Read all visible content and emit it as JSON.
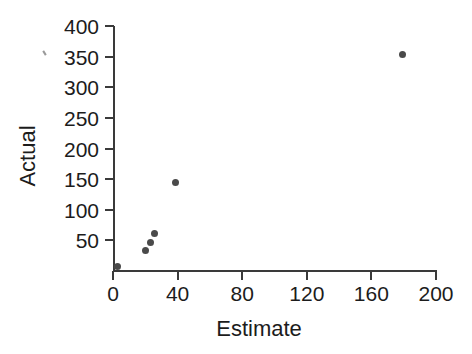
{
  "chart_data": {
    "type": "scatter",
    "title": "",
    "xlabel": "Estimate",
    "ylabel": "Actual",
    "xlim": [
      0,
      200
    ],
    "ylim": [
      0,
      400
    ],
    "xticks": [
      0,
      40,
      80,
      120,
      160,
      200
    ],
    "xtick_labels": [
      "0",
      "40",
      "80",
      "120",
      "160",
      "200"
    ],
    "yticks": [
      50,
      100,
      150,
      200,
      250,
      300,
      350,
      400
    ],
    "ytick_labels": [
      "50",
      "100",
      "150",
      "200",
      "250",
      "300",
      "350",
      "400"
    ],
    "grid": false,
    "legend": null,
    "marker": "circle",
    "marker_color": "#4a4a4a",
    "points": [
      {
        "x": 2.5,
        "y": 8
      },
      {
        "x": 20,
        "y": 33
      },
      {
        "x": 23.5,
        "y": 46
      },
      {
        "x": 26,
        "y": 62
      },
      {
        "x": 38.5,
        "y": 145
      },
      {
        "x": 179,
        "y": 353
      }
    ]
  },
  "axes": {
    "x_axis_name": "estimate-axis",
    "y_axis_name": "actual-axis"
  }
}
